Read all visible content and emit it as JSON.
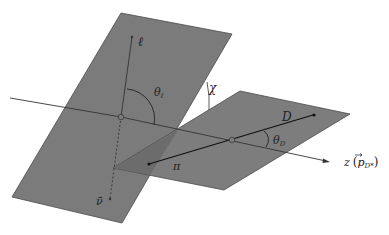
{
  "figure": {
    "type": "kinematic-angles-diagram",
    "colors": {
      "plane_fill": "#7a7a7a",
      "plane_overlap_fill": "#6a6a6a",
      "plane_edge": "#4a4a4a",
      "line": "#333333",
      "background": "#ffffff"
    },
    "labels": {
      "lepton": "ℓ",
      "antineutrino": "ν̄",
      "theta_l": "θℓ",
      "theta_l_main": "θ",
      "theta_l_sub": "ℓ",
      "chi": "χ",
      "D_meson": "D",
      "pion": "π",
      "theta_D_main": "θ",
      "theta_D_sub": "D",
      "z_axis_main": "z",
      "z_axis_paren_open": "(",
      "z_axis_p": "p",
      "z_axis_p_sub": "D*",
      "z_axis_paren_close": ")"
    },
    "elements": {
      "left_plane": "lepton-neutrino decay plane",
      "right_plane": "D-pi decay plane",
      "axis": "z axis along D* momentum"
    }
  }
}
